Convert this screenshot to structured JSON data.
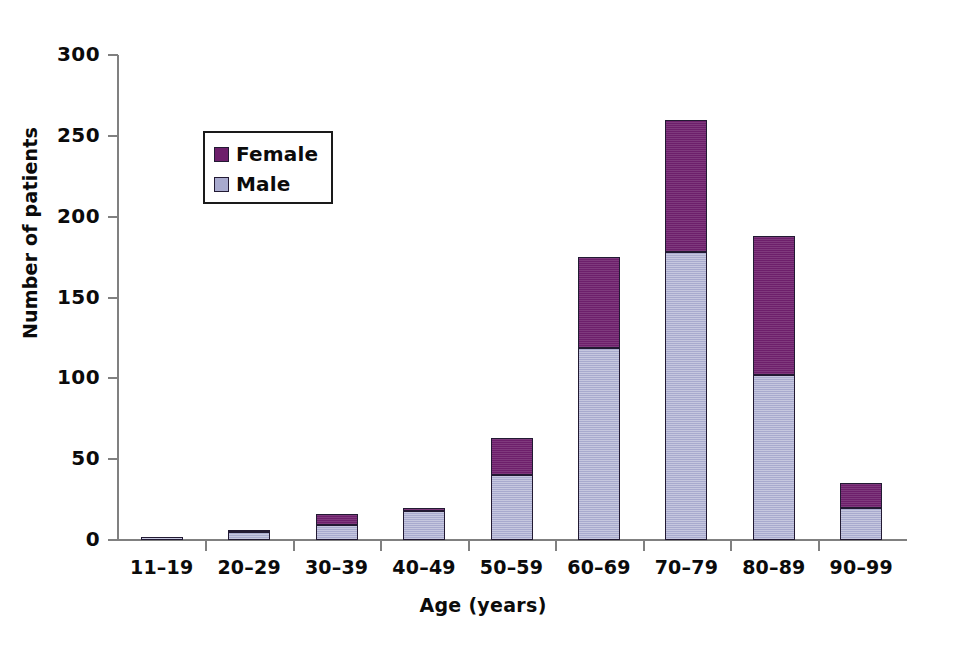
{
  "chart_data": {
    "type": "bar",
    "subtype": "stacked",
    "title": "",
    "xlabel": "Age (years)",
    "ylabel": "Number of patients",
    "categories": [
      "11–19",
      "20–29",
      "30–39",
      "40–49",
      "50–59",
      "60–69",
      "70–79",
      "80–89",
      "90–99"
    ],
    "series": [
      {
        "name": "Male",
        "color": "#a8aace",
        "values": [
          2,
          5,
          9,
          18,
          40,
          119,
          178,
          102,
          20
        ]
      },
      {
        "name": "Female",
        "color": "#6d1f6b",
        "values": [
          0,
          1,
          7,
          2,
          23,
          56,
          82,
          86,
          15
        ]
      }
    ],
    "totals": [
      2,
      6,
      16,
      20,
      63,
      175,
      260,
      188,
      35
    ],
    "ylim": [
      0,
      300
    ],
    "yticks": [
      0,
      50,
      100,
      150,
      200,
      250,
      300
    ],
    "ytick_labels": [
      "0",
      "50",
      "100",
      "150",
      "200",
      "250",
      "300"
    ],
    "grid": false,
    "legend_position": "upper left",
    "legend_entries": [
      "Female",
      "Male"
    ]
  }
}
